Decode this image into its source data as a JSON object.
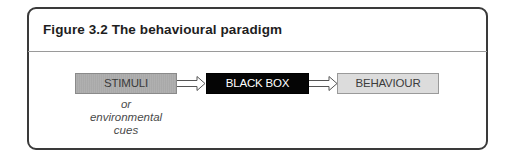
{
  "figure": {
    "label": "Figure 3.2",
    "title": "The behavioural paradigm"
  },
  "diagram": {
    "nodes": [
      {
        "id": "stimuli",
        "label": "STIMULI",
        "fill": "#a9a9a9"
      },
      {
        "id": "black_box",
        "label": "BLACK BOX",
        "fill": "#050505"
      },
      {
        "id": "behaviour",
        "label": "BEHAVIOUR",
        "fill": "#dcdcdc"
      }
    ],
    "edges": [
      {
        "from": "stimuli",
        "to": "black_box",
        "style": "double-line hollow arrow"
      },
      {
        "from": "black_box",
        "to": "behaviour",
        "style": "double-line hollow arrow"
      }
    ],
    "caption_lines": [
      "or",
      "environmental",
      "cues"
    ]
  }
}
